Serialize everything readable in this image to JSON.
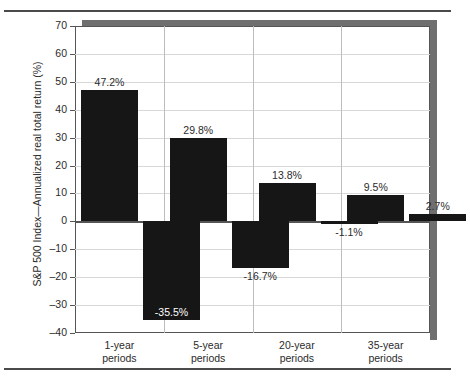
{
  "chart_data": {
    "type": "bar",
    "title": "",
    "xlabel": "",
    "ylabel": "S&P 500 Index—Annualized real total return (%)",
    "ylim": [
      -40,
      70
    ],
    "ytick_step": 10,
    "yticks": [
      "70",
      "60",
      "50",
      "40",
      "30",
      "20",
      "10",
      "0",
      "–10",
      "–20",
      "–30",
      "–40"
    ],
    "grid": true,
    "legend": "none",
    "categories": [
      "1-year\nperiods",
      "5-year\nperiods",
      "20-year\nperiods",
      "35-year\nperiods"
    ],
    "category_lines": [
      "1-year",
      "5-year",
      "20-year",
      "35-year"
    ],
    "category_line2": "periods",
    "series": [
      {
        "name": "best",
        "values": [
          47.2,
          29.8,
          13.8,
          9.5
        ]
      },
      {
        "name": "worst",
        "values": [
          -35.5,
          -16.7,
          -1.1,
          2.7
        ]
      }
    ],
    "bars": [
      {
        "category": "1-year periods",
        "series": "best",
        "value": 47.2,
        "label": "47.2%",
        "label_position": "above"
      },
      {
        "category": "1-year periods",
        "series": "worst",
        "value": -35.5,
        "label": "-35.5%",
        "label_position": "inside"
      },
      {
        "category": "5-year periods",
        "series": "best",
        "value": 29.8,
        "label": "29.8%",
        "label_position": "above"
      },
      {
        "category": "5-year periods",
        "series": "worst",
        "value": -16.7,
        "label": "-16.7%",
        "label_position": "below"
      },
      {
        "category": "20-year periods",
        "series": "best",
        "value": 13.8,
        "label": "13.8%",
        "label_position": "above"
      },
      {
        "category": "20-year periods",
        "series": "worst",
        "value": -1.1,
        "label": "-1.1%",
        "label_position": "below"
      },
      {
        "category": "35-year periods",
        "series": "best",
        "value": 9.5,
        "label": "9.5%",
        "label_position": "above"
      },
      {
        "category": "35-year periods",
        "series": "worst",
        "value": 2.7,
        "label": "2.7%",
        "label_position": "above"
      }
    ],
    "colors": {
      "bar": "#161616",
      "grid": "#d8d8d8",
      "axis": "#555555",
      "shadow": "#6f6f6f",
      "text": "#2b2b2b"
    }
  }
}
